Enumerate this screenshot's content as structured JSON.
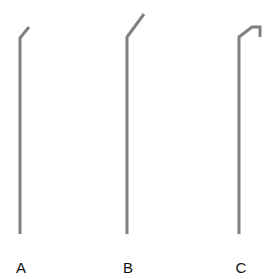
{
  "diagram": {
    "stroke_color": "#808080",
    "stroke_width": 3,
    "shapes": [
      {
        "id": "A",
        "label": "A",
        "points": "20,234 20,38 29,27",
        "label_x": 21,
        "label_y": 267
      },
      {
        "id": "B",
        "label": "B",
        "points": "127,234 127,37 144,14",
        "label_x": 128,
        "label_y": 267
      },
      {
        "id": "C",
        "label": "C",
        "points": "239,234 239,37 252,27 260,27 260,37",
        "label_x": 241,
        "label_y": 267
      }
    ]
  }
}
